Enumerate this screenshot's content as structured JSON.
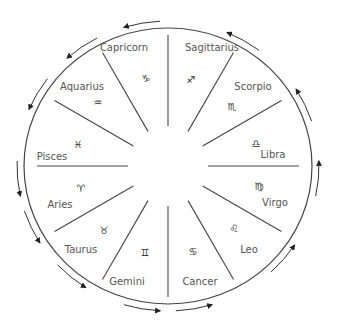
{
  "diagram": {
    "type": "zodiac-wheel",
    "center": [
      168,
      166
    ],
    "outer_rx": 144,
    "outer_ry": 138,
    "divider_inner_r": 40,
    "divider_outer_r": 131,
    "line_color": "#444444",
    "arrow_direction": "counter-clockwise",
    "signs": [
      {
        "name": "Capricorn",
        "symbol": "♑",
        "label_pos": [
          124,
          51
        ],
        "symbol_pos": [
          146,
          82
        ]
      },
      {
        "name": "Sagittarius",
        "symbol": "♐",
        "label_pos": [
          212,
          51
        ],
        "symbol_pos": [
          191,
          83
        ]
      },
      {
        "name": "Scorpio",
        "symbol": "♏",
        "label_pos": [
          253,
          90
        ],
        "symbol_pos": [
          232,
          110
        ]
      },
      {
        "name": "Libra",
        "symbol": "♎",
        "label_pos": [
          273,
          158
        ],
        "symbol_pos": [
          256,
          147
        ]
      },
      {
        "name": "Virgo",
        "symbol": "♍",
        "label_pos": [
          275,
          206
        ],
        "symbol_pos": [
          259,
          190
        ]
      },
      {
        "name": "Leo",
        "symbol": "♌",
        "label_pos": [
          249,
          253
        ],
        "symbol_pos": [
          234,
          232
        ]
      },
      {
        "name": "Cancer",
        "symbol": "♋",
        "label_pos": [
          200,
          285
        ],
        "symbol_pos": [
          193,
          255
        ]
      },
      {
        "name": "Gemini",
        "symbol": "♊",
        "label_pos": [
          127,
          285
        ],
        "symbol_pos": [
          145,
          256
        ]
      },
      {
        "name": "Taurus",
        "symbol": "♉",
        "label_pos": [
          81,
          253
        ],
        "symbol_pos": [
          104,
          234
        ]
      },
      {
        "name": "Aries",
        "symbol": "♈",
        "label_pos": [
          60,
          208
        ],
        "symbol_pos": [
          81,
          192
        ]
      },
      {
        "name": "Pisces",
        "symbol": "♓",
        "label_pos": [
          52,
          160
        ],
        "symbol_pos": [
          78,
          148
        ]
      },
      {
        "name": "Aquarius",
        "symbol": "♒",
        "label_pos": [
          82,
          90
        ],
        "symbol_pos": [
          98,
          106
        ]
      }
    ],
    "arrows_deg": [
      100,
      60,
      25,
      -5,
      -40,
      -80,
      -100,
      -130,
      -155,
      185,
      150,
      125
    ]
  }
}
